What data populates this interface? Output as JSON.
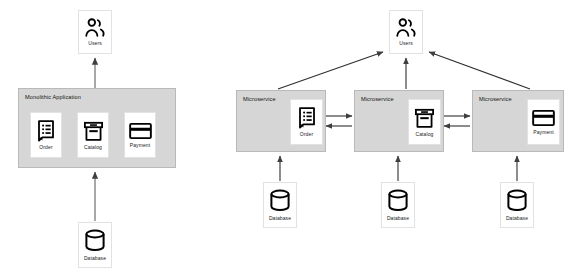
{
  "diagram": {
    "title_monolith": "Monolithic Application",
    "title_microservice": "Microservice",
    "labels": {
      "users": "Users",
      "database": "Database",
      "order": "Order",
      "catalog": "Catalog",
      "payment": "Payment"
    },
    "colors": {
      "container_fill": "#d6d6d6",
      "container_stroke": "#b9b9b9",
      "node_fill": "#ffffff",
      "node_stroke": "#e2e2e2",
      "arrow": "#4a4a4a",
      "icon": "#000000",
      "background": "#ffffff"
    }
  },
  "left_panel": {
    "consumer": {
      "label": "Users",
      "icon": "users-icon"
    },
    "application": {
      "title": "Monolithic Application",
      "components": [
        {
          "label": "Order",
          "icon": "document-list-icon"
        },
        {
          "label": "Catalog",
          "icon": "archive-box-icon"
        },
        {
          "label": "Payment",
          "icon": "credit-card-icon"
        }
      ]
    },
    "datastore": {
      "label": "Database",
      "icon": "database-cylinder-icon"
    }
  },
  "right_panel": {
    "consumer": {
      "label": "Users",
      "icon": "users-icon"
    },
    "services": [
      {
        "title": "Microservice",
        "component": {
          "label": "Order",
          "icon": "document-list-icon"
        },
        "datastore": {
          "label": "Database",
          "icon": "database-cylinder-icon"
        }
      },
      {
        "title": "Microservice",
        "component": {
          "label": "Catalog",
          "icon": "archive-box-icon"
        },
        "datastore": {
          "label": "Database",
          "icon": "database-cylinder-icon"
        }
      },
      {
        "title": "Microservice",
        "component": {
          "label": "Payment",
          "icon": "credit-card-icon"
        },
        "datastore": {
          "label": "Database",
          "icon": "database-cylinder-icon"
        }
      }
    ]
  }
}
